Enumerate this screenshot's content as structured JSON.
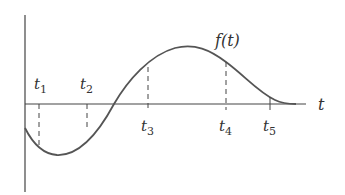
{
  "diagram": {
    "function_label": "f(t)",
    "axis_label": "t",
    "markers": [
      {
        "name": "t",
        "sub": "1"
      },
      {
        "name": "t",
        "sub": "2"
      },
      {
        "name": "t",
        "sub": "3"
      },
      {
        "name": "t",
        "sub": "4"
      },
      {
        "name": "t",
        "sub": "5"
      }
    ],
    "colors": {
      "curve": "#555555",
      "axis": "#444444",
      "text": "#333333"
    }
  }
}
